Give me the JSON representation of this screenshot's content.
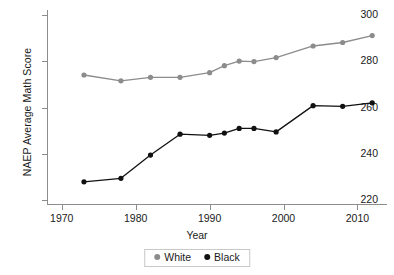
{
  "chart_data": {
    "type": "line",
    "title": "",
    "xlabel": "Year",
    "ylabel": "NAEP Average Math Score",
    "xlim": [
      1968,
      2014
    ],
    "ylim": [
      218,
      302
    ],
    "xticks": [
      1970,
      1980,
      1990,
      2000,
      2010
    ],
    "yticks": [
      220,
      240,
      260,
      280,
      300
    ],
    "grid": false,
    "legend_position": "bottom-center",
    "series": [
      {
        "name": "White",
        "color": "#8c8c8c",
        "x": [
          1973,
          1978,
          1982,
          1986,
          1990,
          1992,
          1994,
          1996,
          1999,
          2004,
          2008,
          2012
        ],
        "values": [
          274,
          271.5,
          273,
          273,
          275,
          278,
          280,
          279.8,
          281.5,
          286.5,
          288,
          291
        ]
      },
      {
        "name": "Black",
        "color": "#111111",
        "x": [
          1973,
          1978,
          1982,
          1986,
          1990,
          1992,
          1994,
          1996,
          1999,
          2004,
          2008,
          2012
        ],
        "values": [
          228,
          229.5,
          239.5,
          248.5,
          248,
          249,
          251,
          251,
          249.5,
          260.8,
          260.5,
          262
        ]
      }
    ]
  },
  "legend": {
    "items": [
      {
        "label": "White",
        "color": "#8c8c8c"
      },
      {
        "label": "Black",
        "color": "#111111"
      }
    ]
  }
}
